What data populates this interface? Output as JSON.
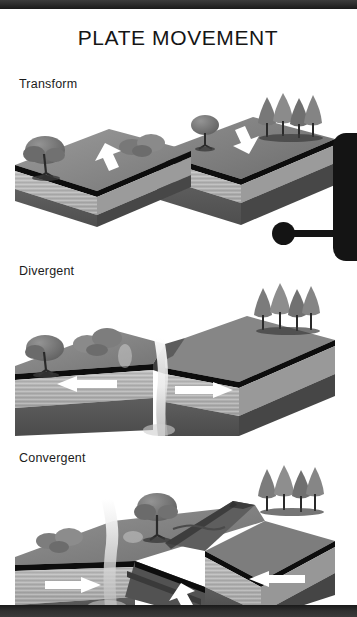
{
  "document": {
    "title": "PLATE MOVEMENT",
    "type": "educational-diagram",
    "color_mode": "grayscale"
  },
  "frame": {
    "top_band_color": "#2e2e2e",
    "bottom_band_color": "#2b2b2b",
    "page_color": "#ffffff"
  },
  "right_tab": {
    "name": "side-tab",
    "color": "#141414",
    "marker": "pin-dot"
  },
  "sections": [
    {
      "id": "transform",
      "label": "Transform",
      "description": "Two crustal blocks slide horizontally past one another along a strike-slip fault.",
      "arrows": [
        {
          "direction": "down-left",
          "color": "#ffffff",
          "block": "left"
        },
        {
          "direction": "up-right",
          "color": "#ffffff",
          "block": "right"
        }
      ],
      "features": [
        "deciduous-tree",
        "shrubs",
        "conifer-cluster",
        "offset-fault"
      ]
    },
    {
      "id": "divergent",
      "label": "Divergent",
      "description": "Two plates move apart; magma rises through the central rift to form new crust.",
      "arrows": [
        {
          "direction": "left",
          "color": "#ffffff",
          "block": "left"
        },
        {
          "direction": "right",
          "color": "#ffffff",
          "block": "right"
        }
      ],
      "features": [
        "deciduous-tree",
        "shrubs",
        "conifer-cluster",
        "rift-valley",
        "magma-plume"
      ]
    },
    {
      "id": "convergent",
      "label": "Convergent",
      "description": "Two plates collide; one subducts beneath the other, producing a volcano and mountain range.",
      "arrows": [
        {
          "direction": "right",
          "color": "#ffffff",
          "block": "left"
        },
        {
          "direction": "left",
          "color": "#ffffff",
          "block": "right"
        },
        {
          "direction": "down-left",
          "color": "#ffffff",
          "block": "subducting-slab"
        }
      ],
      "features": [
        "deciduous-tree",
        "shrubs",
        "conifer-cluster",
        "volcano",
        "mountain-ridge",
        "subduction-zone"
      ]
    }
  ],
  "palette": {
    "surface_top": "#8d8d8d",
    "surface_top_dark": "#6f6f6f",
    "crust_line": "#0d0d0d",
    "sediment": "#b4b4b4",
    "mantle": "#5a5a5a",
    "mantle_deep": "#4a4a4a",
    "vegetation": "#7a7a7a",
    "magma": "#f2f2f2",
    "arrow": "#ffffff"
  }
}
